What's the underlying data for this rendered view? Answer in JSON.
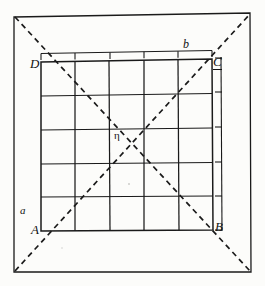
{
  "figure": {
    "background_color": "#fcfcfa",
    "line_color": "#111111",
    "labels": {
      "corner_bottom_left": "A",
      "corner_bottom_right": "B",
      "corner_top_right": "C",
      "corner_top_left": "D",
      "side_top": "b",
      "diagonal_lower_left": "a",
      "center_point": "η"
    },
    "outer_square": {
      "name": "outer-square",
      "top_left": [
        14,
        16
      ],
      "top_right": [
        250,
        14
      ],
      "bottom_right": [
        251,
        272
      ],
      "bottom_left": [
        14,
        272
      ]
    },
    "inner_square": {
      "name": "inner-square-ABCD",
      "top_left": [
        40,
        62
      ],
      "top_right": [
        212,
        59
      ],
      "bottom_right": [
        213,
        230
      ],
      "bottom_left": [
        41,
        231
      ]
    },
    "grid": {
      "rows": 5,
      "columns": 5,
      "cell_count": 25
    },
    "diagonals": {
      "count": 2,
      "style": "dashed",
      "description": "Two dashed diagonals span the outer square corner to corner and cross at the centre point."
    },
    "right_scale": {
      "name": "right-tick-scale",
      "tick_count": 5,
      "orientation": "vertical"
    },
    "top_scale": {
      "name": "top-tick-scale",
      "tick_count": 5,
      "orientation": "horizontal"
    }
  }
}
